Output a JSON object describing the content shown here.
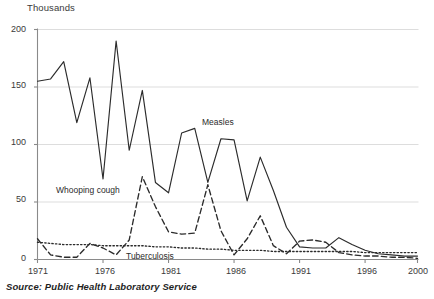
{
  "chart_data": {
    "type": "line",
    "title": "",
    "subtitle": "",
    "unit_label": "Thousands",
    "xlabel": "",
    "ylabel": "Thousands",
    "xlim": [
      1971,
      2000
    ],
    "ylim": [
      0,
      200
    ],
    "yticks": [
      0,
      50,
      100,
      150,
      200
    ],
    "ytick_labels": [
      "0",
      "50",
      "100",
      "150",
      "200"
    ],
    "xticks": [
      1971,
      1976,
      1981,
      1986,
      1991,
      1996,
      2000
    ],
    "xtick_labels": [
      "1971",
      "1976",
      "1981",
      "1986",
      "1991",
      "1996",
      "2000"
    ],
    "grid": "horizontal",
    "legend_position": "inline-annotations",
    "x": [
      1971,
      1972,
      1973,
      1974,
      1975,
      1976,
      1977,
      1978,
      1979,
      1980,
      1981,
      1982,
      1983,
      1984,
      1985,
      1986,
      1987,
      1988,
      1989,
      1990,
      1991,
      1992,
      1993,
      1994,
      1995,
      1996,
      1997,
      1998,
      1999,
      2000
    ],
    "series": [
      {
        "name": "Measles",
        "style": "solid",
        "color": "#2b2b2b",
        "label_x": 1984,
        "label_y": 122,
        "values": [
          155,
          157,
          172,
          119,
          158,
          70,
          190,
          95,
          147,
          67,
          58,
          110,
          114,
          67,
          105,
          104,
          51,
          89,
          60,
          28,
          11,
          10,
          10,
          19,
          13,
          8,
          5,
          4,
          3,
          3
        ]
      },
      {
        "name": "Whooping cough",
        "style": "dashed",
        "color": "#2b2b2b",
        "label_x": 1975,
        "label_y": 58,
        "values": [
          18,
          4,
          2,
          2,
          14,
          10,
          4,
          17,
          72,
          46,
          24,
          22,
          23,
          65,
          25,
          4,
          18,
          38,
          12,
          5,
          16,
          17,
          15,
          6,
          4,
          3,
          3,
          2,
          2,
          1
        ]
      },
      {
        "name": "Tuberculosis",
        "style": "dotted",
        "color": "#2b2b2b",
        "label_x": 1982,
        "label_y": 3,
        "values": [
          15,
          14,
          13,
          13,
          13,
          12,
          12,
          12,
          12,
          11,
          11,
          10,
          10,
          9,
          9,
          8,
          8,
          8,
          7,
          7,
          7,
          7,
          7,
          7,
          7,
          6,
          6,
          6,
          6,
          6
        ]
      }
    ],
    "source": "Source: Public Health Laboratory Service"
  },
  "axes": {
    "unit": "Thousands"
  }
}
